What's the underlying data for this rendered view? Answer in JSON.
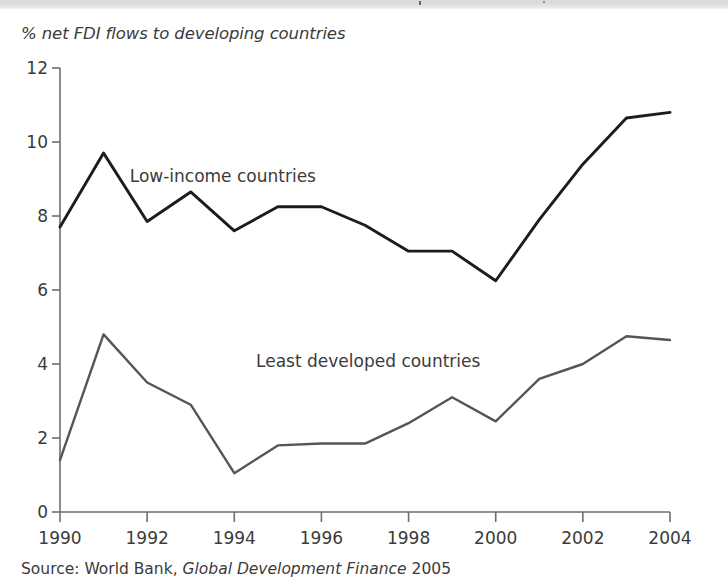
{
  "figure": {
    "axis_title": "% net FDI flows to developing countries",
    "source_prefix": "Source: World Bank,",
    "source_italic": "Global Development Finance",
    "source_year": "2005"
  },
  "colors": {
    "low_income_line": "#1c1c1c",
    "least_developed_line": "#555555",
    "axis": "#6e6e6e",
    "text": "#3b3b3b",
    "background": "#ffffff",
    "scan_band": "#dedede"
  },
  "chart_data": {
    "type": "line",
    "title": "",
    "subtitle": "",
    "xlabel": "",
    "ylabel": "% net FDI flows to developing countries",
    "x": [
      1990,
      1991,
      1992,
      1993,
      1994,
      1995,
      1996,
      1997,
      1998,
      1999,
      2000,
      2001,
      2002,
      2003,
      2004
    ],
    "xtick_labels": [
      "1990",
      "1992",
      "1994",
      "1996",
      "1998",
      "2000",
      "2002",
      "2004"
    ],
    "xticks": [
      1990,
      1992,
      1994,
      1996,
      1998,
      2000,
      2002,
      2004
    ],
    "ytick_labels": [
      "0",
      "2",
      "4",
      "6",
      "8",
      "10",
      "12"
    ],
    "yticks": [
      0,
      2,
      4,
      6,
      8,
      10,
      12
    ],
    "xlim": [
      1990,
      2004
    ],
    "ylim": [
      0,
      12
    ],
    "grid": false,
    "legend_position": "inline-annotation",
    "series": [
      {
        "name": "Low-income countries",
        "color": "#1c1c1c",
        "values": [
          7.7,
          9.7,
          7.85,
          8.65,
          7.6,
          8.25,
          8.25,
          7.75,
          7.05,
          7.05,
          6.25,
          7.9,
          9.4,
          10.65,
          10.8
        ]
      },
      {
        "name": "Least developed countries",
        "color": "#555555",
        "values": [
          1.4,
          4.8,
          3.5,
          2.9,
          1.05,
          1.8,
          1.85,
          1.85,
          2.4,
          3.1,
          2.45,
          3.6,
          4.0,
          4.75,
          4.65
        ]
      }
    ],
    "annotations": [
      {
        "text": "Low-income countries",
        "x": 1991.6,
        "y": 9.05
      },
      {
        "text": "Least developed countries",
        "x": 1994.5,
        "y": 4.05
      }
    ]
  }
}
